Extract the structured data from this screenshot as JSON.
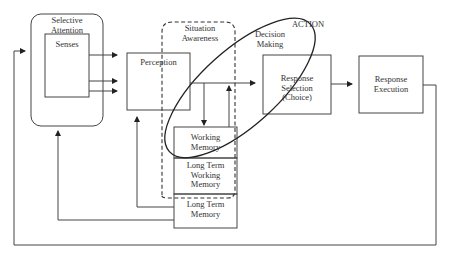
{
  "diagram": {
    "type": "cognitive-process-model",
    "nodes": {
      "selective_attention": "Selective Attention",
      "senses": "Senses",
      "perception": "Perception",
      "situation_awareness": "Situation Awareness",
      "decision_making": "Decision Making",
      "action": "ACTION",
      "response_selection": "Response Selection (Choice)",
      "response_execution": "Response Execution",
      "working_memory": "Working Memory",
      "long_term_working_memory": "Long Term Working Memory",
      "long_term_memory": "Long Term Memory"
    },
    "labels": {
      "selective_attention_l1": "Selective",
      "selective_attention_l2": "Attention",
      "senses": "Senses",
      "perception": "Perception",
      "situation_awareness_l1": "Situation",
      "situation_awareness_l2": "Awareness",
      "decision_making_l1": "Decision",
      "decision_making_l2": "Making",
      "action": "ACTION",
      "response_selection_l1": "Response",
      "response_selection_l2": "Selection",
      "response_selection_l3": "(Choice)",
      "response_execution_l1": "Response",
      "response_execution_l2": "Execution",
      "working_memory_l1": "Working",
      "working_memory_l2": "Memory",
      "ltwm_l1": "Long Term",
      "ltwm_l2": "Working",
      "ltwm_l3": "Memory",
      "ltm_l1": "Long Term",
      "ltm_l2": "Memory"
    },
    "edges": [
      {
        "from": "senses",
        "to": "perception",
        "count": 3
      },
      {
        "from": "perception",
        "to": "response_selection"
      },
      {
        "from": "perception",
        "to": "working_memory"
      },
      {
        "from": "working_memory",
        "to": "response_selection"
      },
      {
        "from": "response_selection",
        "to": "response_execution"
      },
      {
        "from": "response_execution",
        "to": "selective_attention",
        "via": "feedback-loop"
      },
      {
        "from": "long_term_memory",
        "to": "perception"
      },
      {
        "from": "long_term_memory",
        "to": "selective_attention"
      }
    ]
  }
}
